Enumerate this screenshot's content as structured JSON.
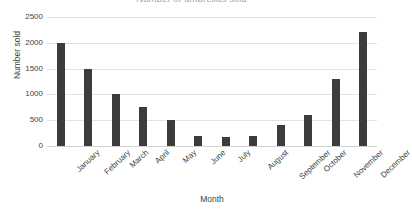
{
  "chart_data": {
    "type": "bar",
    "title": "Number of umbrellas sold",
    "xlabel": "Month",
    "ylabel": "Number sold",
    "categories": [
      "January",
      "February",
      "March",
      "April",
      "May",
      "June",
      "July",
      "August",
      "September",
      "October",
      "November",
      "December"
    ],
    "values": [
      2000,
      1500,
      1000,
      750,
      500,
      200,
      175,
      200,
      400,
      600,
      1300,
      2200
    ],
    "ylim": [
      0,
      2500
    ],
    "yticks": [
      0,
      500,
      1000,
      1500,
      2000,
      2500
    ],
    "ytick_labels": [
      "0",
      "500",
      "1000",
      "1500",
      "2000",
      "2500"
    ],
    "grid": "horizontal",
    "legend": "none",
    "bar_color": "#3c3c3c",
    "gridline_color": "#e2e2e2",
    "background_color": "#ffffff",
    "text_color": "#3f3f3f"
  }
}
